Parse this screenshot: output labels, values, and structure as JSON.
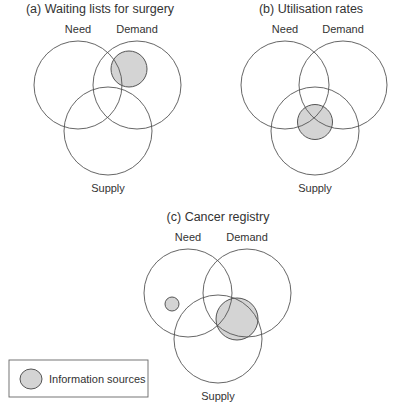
{
  "diagrams": [
    {
      "title": "(a) Waiting lists for surgery",
      "labels": {
        "need": "Need",
        "demand": "Demand",
        "supply": "Supply"
      }
    },
    {
      "title": "(b) Utilisation rates",
      "labels": {
        "need": "Need",
        "demand": "Demand",
        "supply": "Supply"
      }
    },
    {
      "title": "(c) Cancer registry",
      "labels": {
        "need": "Need",
        "demand": "Demand",
        "supply": "Supply"
      }
    }
  ],
  "legend": {
    "label": "Information sources",
    "color": "#d4d4d4"
  },
  "colors": {
    "stroke": "#555555",
    "shade": "#d4d4d4"
  }
}
